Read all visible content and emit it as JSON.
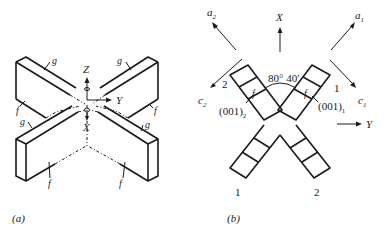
{
  "figure_a": {
    "caption": "(a)",
    "axes": {
      "z": "Z",
      "y": "Y",
      "x": "X"
    },
    "face_labels": {
      "g": "g",
      "f": "f"
    }
  },
  "figure_b": {
    "caption": "(b)",
    "axes": {
      "x": "X",
      "y": "Y",
      "a1": "a",
      "a1_sub": "1",
      "a2": "a",
      "a2_sub": "2",
      "c1": "c",
      "c1_sub": "1",
      "c2": "c",
      "c2_sub": "2"
    },
    "angle": "80° 40′",
    "plane_1": "(001)",
    "plane_1_sub": "1",
    "plane_2": "(001)",
    "plane_2_sub": "2",
    "face_f": "f",
    "arm_labels": {
      "top_left": "2",
      "top_right": "1",
      "bottom_left": "1",
      "bottom_right": "2"
    }
  }
}
